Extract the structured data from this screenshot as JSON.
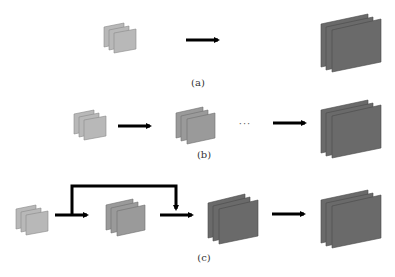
{
  "colors": {
    "small_block": "#b8b8b8",
    "small_block_edge": "#8a8a8a",
    "medium_block": "#9a9a9a",
    "medium_block_edge": "#6e6e6e",
    "large_block": "#6a6a6a",
    "large_block_edge": "#4a4a4a",
    "arrow": "#000000",
    "background": "#ffffff"
  },
  "panels": [
    {
      "id": "a",
      "label": "(a)",
      "components": [
        "small-block",
        "arrow",
        "large-block"
      ]
    },
    {
      "id": "b",
      "label": "(b)",
      "components": [
        "small-block",
        "arrow",
        "medium-block",
        "ellipsis",
        "arrow",
        "large-block"
      ],
      "ellipsis": "···"
    },
    {
      "id": "c",
      "label": "(c)",
      "components": [
        "small-block",
        "arrow",
        "medium-block",
        "skip-connection",
        "large-block",
        "arrow",
        "large-block"
      ]
    }
  ]
}
